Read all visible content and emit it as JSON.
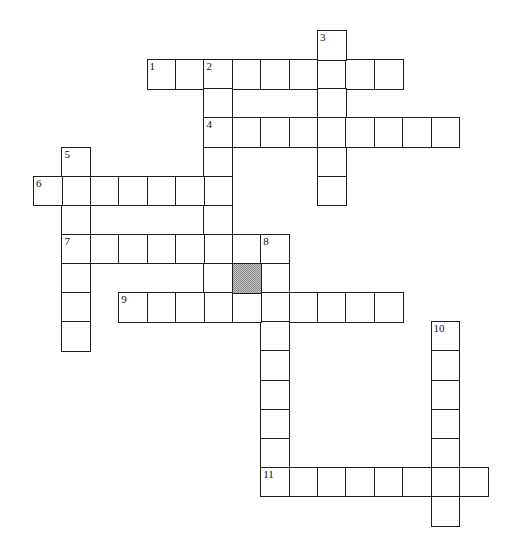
{
  "puzzle": {
    "grid_origin": {
      "x": 33,
      "y": 30
    },
    "cell_width": 28.4,
    "cell_height": 29.13,
    "colors": {
      "border": "#1e1e1e",
      "cell_fill": "#ffffff",
      "blocked_fill": "#a8a8a8"
    },
    "entries": [
      {
        "number": "1",
        "direction": "across",
        "row": 1,
        "col": 4,
        "length": 9
      },
      {
        "number": "2",
        "direction": "down",
        "row": 1,
        "col": 6,
        "length": 9
      },
      {
        "number": "3",
        "direction": "down",
        "row": 0,
        "col": 10,
        "length": 6
      },
      {
        "number": "4",
        "direction": "across",
        "row": 3,
        "col": 6,
        "length": 9
      },
      {
        "number": "5",
        "direction": "down",
        "row": 4,
        "col": 1,
        "length": 7
      },
      {
        "number": "6",
        "direction": "across",
        "row": 5,
        "col": 0,
        "length": 7
      },
      {
        "number": "7",
        "direction": "across",
        "row": 7,
        "col": 1,
        "length": 8
      },
      {
        "number": "8",
        "direction": "down",
        "row": 7,
        "col": 8,
        "length": 9
      },
      {
        "number": "9",
        "direction": "across",
        "row": 9,
        "col": 3,
        "length": 10
      },
      {
        "number": "10",
        "direction": "down",
        "row": 10,
        "col": 14,
        "length": 7
      },
      {
        "number": "11",
        "direction": "across",
        "row": 15,
        "col": 8,
        "length": 8
      }
    ],
    "blocked_cells": [
      {
        "row": 8,
        "col": 7
      }
    ]
  }
}
